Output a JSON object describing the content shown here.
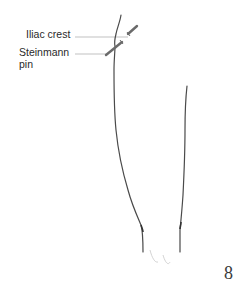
{
  "figure": {
    "labels": {
      "iliac_crest": "Iliac crest",
      "steinmann_line1": "Steinmann",
      "steinmann_line2": "pin"
    },
    "figure_number": "8"
  },
  "colors": {
    "line": "#4a4a4a",
    "leader": "#9a9a9a",
    "text": "#2a2a2a"
  }
}
